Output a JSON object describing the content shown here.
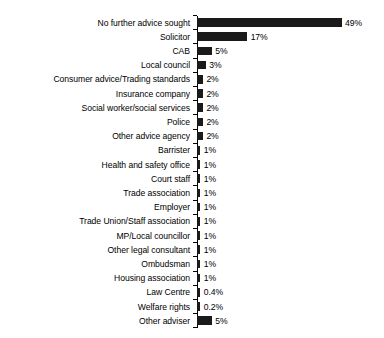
{
  "chart_data": {
    "type": "bar",
    "orientation": "horizontal",
    "title": "",
    "subtitle": "",
    "xlabel": "",
    "ylabel": "",
    "xlim": [
      0,
      49
    ],
    "grid": false,
    "legend": null,
    "bar_color": "#1a1a1a",
    "background_color": "#ffffff",
    "categories": [
      "No further advice sought",
      "Solicitor",
      "CAB",
      "Local council",
      "Consumer advice/Trading standards",
      "Insurance company",
      "Social worker/social services",
      "Police",
      "Other advice agency",
      "Barrister",
      "Health and safety office",
      "Court staff",
      "Trade association",
      "Employer",
      "Trade Union/Staff association",
      "MP/Local councillor",
      "Other legal consultant",
      "Ombudsman",
      "Housing association",
      "Law Centre",
      "Welfare rights",
      "Other adviser"
    ],
    "values": [
      49,
      17,
      5,
      3,
      2,
      2,
      2,
      2,
      2,
      1,
      1,
      1,
      1,
      1,
      1,
      1,
      1,
      1,
      1,
      0.4,
      0.2,
      5
    ],
    "value_labels": [
      "49%",
      "17%",
      "5%",
      "3%",
      "2%",
      "2%",
      "2%",
      "2%",
      "2%",
      "1%",
      "1%",
      "1%",
      "1%",
      "1%",
      "1%",
      "1%",
      "1%",
      "1%",
      "1%",
      "0.4%",
      "0.2%",
      "5%"
    ]
  }
}
